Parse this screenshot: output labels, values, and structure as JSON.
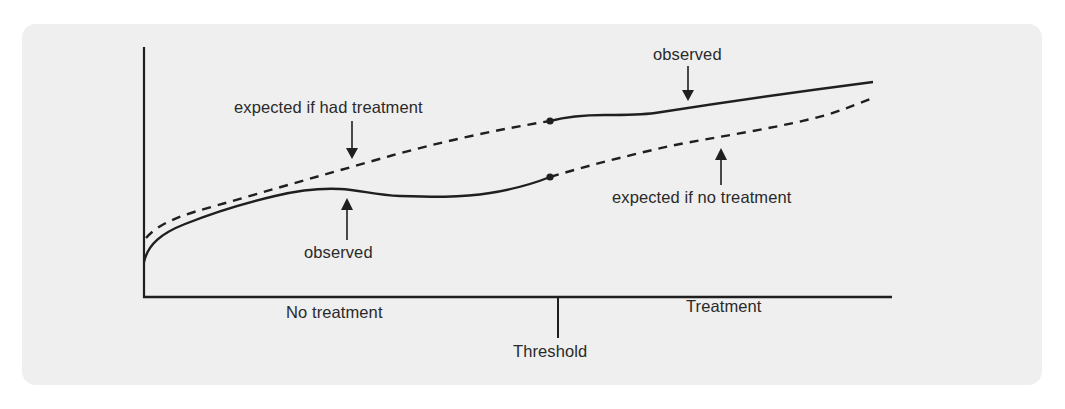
{
  "diagram": {
    "type": "regression-discontinuity",
    "background_color": "#efefef",
    "line_color": "#1f1f1f",
    "axes": {
      "x_axis_left_label": "No treatment",
      "x_axis_right_label": "Treatment",
      "threshold_label": "Threshold"
    },
    "annotations": {
      "expected_had_treatment": "expected if had treatment",
      "observed_left": "observed",
      "observed_right": "observed",
      "expected_no_treatment": "expected if no treatment"
    },
    "series": [
      {
        "name": "observed (no treatment)",
        "style": "solid",
        "region": "left of threshold"
      },
      {
        "name": "expected if had treatment",
        "style": "dashed",
        "region": "left of threshold"
      },
      {
        "name": "observed (treatment)",
        "style": "solid",
        "region": "right of threshold"
      },
      {
        "name": "expected if no treatment",
        "style": "dashed",
        "region": "right of threshold"
      }
    ]
  }
}
